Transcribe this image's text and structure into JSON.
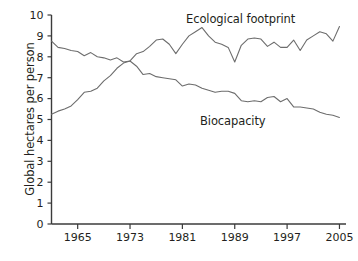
{
  "chart_data": {
    "type": "line",
    "title": "",
    "xlabel": "",
    "ylabel": "Global hectares per person",
    "xlim": [
      1961,
      2006
    ],
    "ylim": [
      0,
      10
    ],
    "xticks": [
      1965,
      1973,
      1981,
      1989,
      1997,
      2005
    ],
    "yticks": [
      0,
      1,
      2,
      3,
      4,
      5,
      6,
      7,
      8,
      9,
      10
    ],
    "grid": false,
    "legend_position": "inline-annotations",
    "line_color": "#6d6d6d",
    "axis_color": "#3b3b3b",
    "x": [
      1961,
      1962,
      1963,
      1964,
      1965,
      1966,
      1967,
      1968,
      1969,
      1970,
      1971,
      1972,
      1973,
      1974,
      1975,
      1976,
      1977,
      1978,
      1979,
      1980,
      1981,
      1982,
      1983,
      1984,
      1985,
      1986,
      1987,
      1988,
      1989,
      1990,
      1991,
      1992,
      1993,
      1994,
      1995,
      1996,
      1997,
      1998,
      1999,
      2000,
      2001,
      2002,
      2003,
      2004,
      2005
    ],
    "series": [
      {
        "name": "Biocapacity",
        "values": [
          8.75,
          8.45,
          8.4,
          8.3,
          8.25,
          8.05,
          8.2,
          8.0,
          7.95,
          7.85,
          7.95,
          7.75,
          7.8,
          7.55,
          7.15,
          7.2,
          7.05,
          7.0,
          6.95,
          6.9,
          6.6,
          6.7,
          6.65,
          6.5,
          6.4,
          6.3,
          6.35,
          6.35,
          6.25,
          5.9,
          5.85,
          5.9,
          5.85,
          6.05,
          6.1,
          5.85,
          6.0,
          5.6,
          5.6,
          5.55,
          5.5,
          5.35,
          5.25,
          5.2,
          5.1
        ]
      },
      {
        "name": "Ecological footprint",
        "values": [
          5.25,
          5.4,
          5.5,
          5.65,
          5.95,
          6.3,
          6.35,
          6.5,
          6.85,
          7.1,
          7.45,
          7.7,
          7.8,
          8.15,
          8.25,
          8.5,
          8.8,
          8.85,
          8.6,
          8.15,
          8.6,
          9.0,
          9.2,
          9.4,
          9.0,
          8.7,
          8.6,
          8.45,
          7.75,
          8.55,
          8.85,
          8.9,
          8.85,
          8.5,
          8.7,
          8.45,
          8.45,
          8.8,
          8.3,
          8.8,
          9.0,
          9.2,
          9.1,
          8.75,
          9.45
        ]
      }
    ],
    "annotations": [
      {
        "text": "Ecological footprint",
        "x": 1984,
        "y": 9.9
      },
      {
        "text": "Biocapacity",
        "x": 1986,
        "y": 5.2
      }
    ]
  }
}
